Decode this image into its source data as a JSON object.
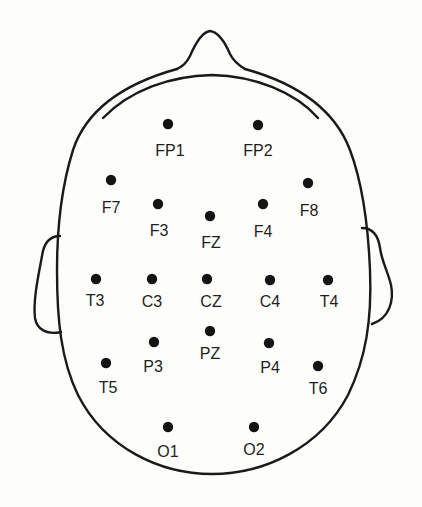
{
  "diagram": {
    "type": "EEG 10-20 electrode placement (top view of head)",
    "head": {
      "nose_tip": [
        210,
        31
      ],
      "center_x": 212,
      "bottom_y": 474
    },
    "electrodes": [
      {
        "label": "FP1",
        "dot": [
          168,
          124
        ],
        "text": [
          170,
          156
        ]
      },
      {
        "label": "FP2",
        "dot": [
          258,
          125
        ],
        "text": [
          258,
          156
        ]
      },
      {
        "label": "F7",
        "dot": [
          111,
          180
        ],
        "text": [
          111,
          213
        ]
      },
      {
        "label": "F3",
        "dot": [
          158,
          204
        ],
        "text": [
          159,
          236
        ]
      },
      {
        "label": "FZ",
        "dot": [
          210,
          216
        ],
        "text": [
          211,
          248
        ]
      },
      {
        "label": "F4",
        "dot": [
          263,
          204
        ],
        "text": [
          263,
          237
        ]
      },
      {
        "label": "F8",
        "dot": [
          308,
          183
        ],
        "text": [
          309,
          216
        ]
      },
      {
        "label": "T3",
        "dot": [
          96,
          279
        ],
        "text": [
          95,
          306
        ]
      },
      {
        "label": "C3",
        "dot": [
          152,
          279
        ],
        "text": [
          152,
          307
        ]
      },
      {
        "label": "CZ",
        "dot": [
          207,
          279
        ],
        "text": [
          211,
          307
        ]
      },
      {
        "label": "C4",
        "dot": [
          270,
          280
        ],
        "text": [
          270,
          307
        ]
      },
      {
        "label": "T4",
        "dot": [
          328,
          280
        ],
        "text": [
          329,
          307
        ]
      },
      {
        "label": "PZ",
        "dot": [
          210,
          331
        ],
        "text": [
          210,
          359
        ]
      },
      {
        "label": "P3",
        "dot": [
          154,
          342
        ],
        "text": [
          153,
          372
        ]
      },
      {
        "label": "P4",
        "dot": [
          269,
          343
        ],
        "text": [
          270,
          373
        ]
      },
      {
        "label": "T5",
        "dot": [
          106,
          363
        ],
        "text": [
          108,
          393
        ]
      },
      {
        "label": "T6",
        "dot": [
          318,
          366
        ],
        "text": [
          318,
          394
        ]
      },
      {
        "label": "O1",
        "dot": [
          168,
          427
        ],
        "text": [
          168,
          457
        ]
      },
      {
        "label": "O2",
        "dot": [
          254,
          427
        ],
        "text": [
          254,
          455
        ]
      }
    ],
    "colors": {
      "background": "#fdfdfb",
      "line": "#1a1a1a",
      "dot": "#141414",
      "text": "#1e1e1e"
    }
  }
}
